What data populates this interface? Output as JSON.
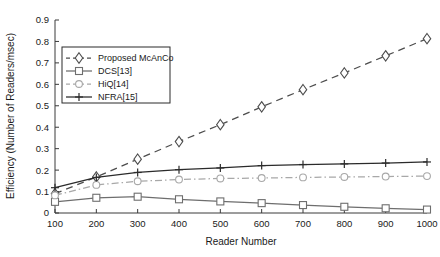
{
  "chart_data": {
    "type": "line",
    "title": "",
    "xlabel": "Reader Number",
    "ylabel": "Efficiency (Number of Readers/msec)",
    "x": [
      100,
      200,
      300,
      400,
      500,
      600,
      700,
      800,
      900,
      1000
    ],
    "xticklabels": [
      "100",
      "200",
      "300",
      "400",
      "500",
      "600",
      "700",
      "800",
      "900",
      "1000"
    ],
    "yticklabels": [
      "0",
      "0.1",
      "0.2",
      "0.3",
      "0.4",
      "0.5",
      "0.6",
      "0.7",
      "0.8",
      "0.9"
    ],
    "yticks": [
      0,
      0.1,
      0.2,
      0.3,
      0.4,
      0.5,
      0.6,
      0.7,
      0.8,
      0.9
    ],
    "xlim": [
      100,
      1000
    ],
    "ylim": [
      0,
      0.9
    ],
    "grid": false,
    "legend_position": "upper-left",
    "series": [
      {
        "name": "Proposed McAnCo",
        "marker": "diamond",
        "linestyle": "dashed",
        "color": "#4d4d4d",
        "values": [
          0.09,
          0.168,
          0.251,
          0.333,
          0.412,
          0.495,
          0.575,
          0.653,
          0.733,
          0.813
        ]
      },
      {
        "name": "DCS[13]",
        "marker": "square",
        "linestyle": "solid",
        "color": "#6e6e6e",
        "values": [
          0.052,
          0.071,
          0.076,
          0.064,
          0.054,
          0.046,
          0.037,
          0.029,
          0.022,
          0.016
        ]
      },
      {
        "name": "HiQ[14]",
        "marker": "circle",
        "linestyle": "dashdot",
        "color": "#a8a8a8",
        "values": [
          0.082,
          0.131,
          0.148,
          0.156,
          0.161,
          0.163,
          0.166,
          0.168,
          0.17,
          0.172
        ]
      },
      {
        "name": "NFRA[15]",
        "marker": "plus",
        "linestyle": "solid",
        "color": "#2b2b2b",
        "values": [
          0.118,
          0.166,
          0.189,
          0.202,
          0.21,
          0.221,
          0.226,
          0.229,
          0.233,
          0.238
        ]
      }
    ]
  },
  "legend": {
    "entries": [
      {
        "label": "Proposed McAnCo"
      },
      {
        "label": "DCS[13]"
      },
      {
        "label": "HiQ[14]"
      },
      {
        "label": "NFRA[15]"
      }
    ]
  },
  "colors": {
    "axis": "#3a3a3a",
    "background": "#ffffff",
    "text": "#1a1a1a"
  }
}
